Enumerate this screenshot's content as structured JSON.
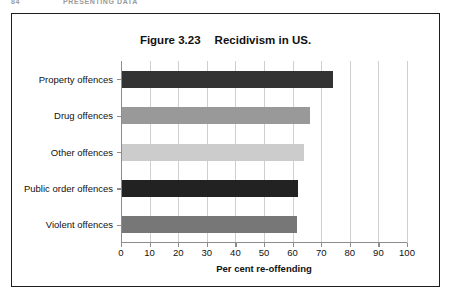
{
  "page_header": {
    "folio": "84",
    "running_head": "PRESENTING DATA"
  },
  "figure": {
    "number": "Figure 3.23",
    "title": "Recidivism in US."
  },
  "chart_data": {
    "type": "bar",
    "orientation": "horizontal",
    "xlabel": "Per cent re-offending",
    "ylabel": "",
    "xlim": [
      0,
      100
    ],
    "xticks": [
      0,
      10,
      20,
      30,
      40,
      50,
      60,
      70,
      80,
      90,
      100
    ],
    "xtick_labels": [
      "0",
      "10",
      "20",
      "30",
      "40",
      "50",
      "60",
      "70",
      "80",
      "90",
      "100"
    ],
    "grid": "vertical",
    "legend": "none",
    "categories": [
      "Property offences",
      "Drug offences",
      "Other offences",
      "Public order offences",
      "Violent offences"
    ],
    "values": [
      74,
      66,
      64,
      62,
      61.5
    ],
    "bar_colors": [
      "#333333",
      "#999999",
      "#cccccc",
      "#222222",
      "#777777"
    ],
    "bars": [
      {
        "label": "Property offences",
        "value": 74,
        "color": "#333333"
      },
      {
        "label": "Drug offences",
        "value": 66,
        "color": "#999999"
      },
      {
        "label": "Other offences",
        "value": 64,
        "color": "#cccccc"
      },
      {
        "label": "Public order offences",
        "value": 62,
        "color": "#222222"
      },
      {
        "label": "Violent offences",
        "value": 61.5,
        "color": "#777777"
      }
    ]
  },
  "colors": {
    "frame": "#1d1d1d",
    "axis": "#8d8d8d",
    "gridline": "#cfcfcf",
    "text": "#111111"
  }
}
